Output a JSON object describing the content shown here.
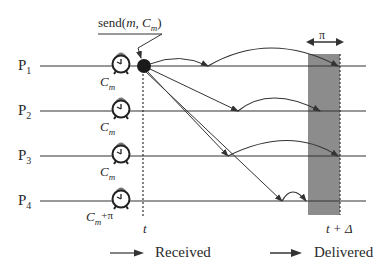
{
  "diagram": {
    "title_annotation": "send(m, C_m)",
    "send_label": {
      "prefix": "send(",
      "m": "m",
      "sep": ", ",
      "C": "C",
      "sub": "m",
      "suffix": ")"
    },
    "processes": [
      {
        "name": "P",
        "sub": "1",
        "clock_label": "C",
        "clock_sub": "m",
        "clock_extra": ""
      },
      {
        "name": "P",
        "sub": "2",
        "clock_label": "C",
        "clock_sub": "m",
        "clock_extra": ""
      },
      {
        "name": "P",
        "sub": "3",
        "clock_label": "C",
        "clock_sub": "m",
        "clock_extra": ""
      },
      {
        "name": "P",
        "sub": "4",
        "clock_label": "C",
        "clock_sub": "m",
        "clock_extra": "+π"
      }
    ],
    "time_labels": {
      "t": "t",
      "t_delta": "t + Δ"
    },
    "window_label": "π",
    "legend": [
      {
        "label": "Received",
        "icon": "received-arrow-icon"
      },
      {
        "label": "Delivered",
        "icon": "delivered-arrow-icon"
      }
    ],
    "colors": {
      "line": "#333333",
      "window": "#8c8c8c",
      "clock_bell": "#7a7a7a"
    }
  }
}
